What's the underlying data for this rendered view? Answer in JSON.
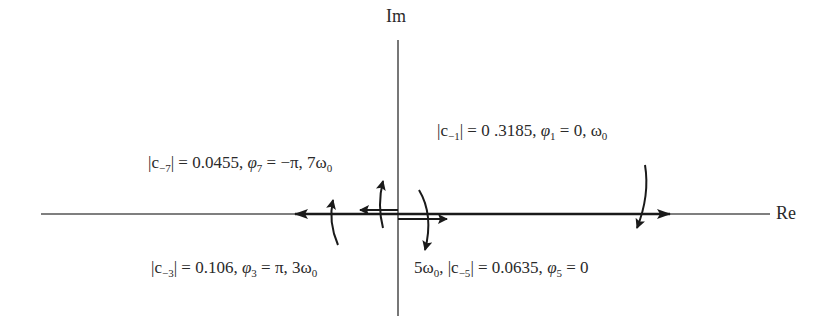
{
  "diagram": {
    "type": "phasor-diagram",
    "axes": {
      "real_label": "Re",
      "imag_label": "Im",
      "origin_px": [
        398,
        214
      ]
    },
    "colors": {
      "axis": "#555555",
      "vector": "#1a1a1a",
      "text": "#2a2a2a"
    },
    "phasors": [
      {
        "name": "c-1",
        "magnitude_text": "0 .3185",
        "phase_text": "0",
        "frequency_text": "ω0",
        "direction": "positive-real",
        "rotation_arrow": "down",
        "tip_px": [
          670,
          214
        ],
        "label": {
          "prefix": "|c",
          "sub": "−1",
          "mid": "| = 0 .3185, ",
          "phi_sub": "1",
          "rest": " = 0,  ω",
          "omega_sub": "0",
          "pos": [
            437,
            120
          ]
        }
      },
      {
        "name": "c-3",
        "magnitude_text": "0.106",
        "phase_text": "π",
        "frequency_text": "3ω0",
        "direction": "negative-real",
        "rotation_arrow": "up",
        "tip_px": [
          295,
          214
        ],
        "label": {
          "prefix": "|c",
          "sub": "−3",
          "mid": "| = 0.106, ",
          "phi_sub": "3",
          "rest": " = π, 3ω",
          "omega_sub": "0",
          "pos": [
            151,
            257
          ]
        }
      },
      {
        "name": "c-5",
        "magnitude_text": "0.0635",
        "phase_text": "0",
        "frequency_text": "5ω0",
        "direction": "positive-real",
        "rotation_arrow": "down",
        "tip_px": [
          440,
          217
        ],
        "label": {
          "lead": "5ω",
          "lead_sub": "0",
          "prefix": ", |c",
          "sub": "−5",
          "mid": "| = 0.0635, ",
          "phi_sub": "5",
          "rest": " = 0",
          "pos": [
            414,
            257
          ]
        }
      },
      {
        "name": "c-7",
        "magnitude_text": "0.0455",
        "phase_text": "−π",
        "frequency_text": "7ω0",
        "direction": "negative-real",
        "rotation_arrow": "up",
        "tip_px": [
          360,
          210
        ],
        "label": {
          "prefix": "|c",
          "sub": "−7",
          "mid": "| = 0.0455, ",
          "phi_sub": "7",
          "rest": " = −π, 7ω",
          "omega_sub": "0",
          "pos": [
            148,
            152
          ]
        }
      }
    ]
  }
}
